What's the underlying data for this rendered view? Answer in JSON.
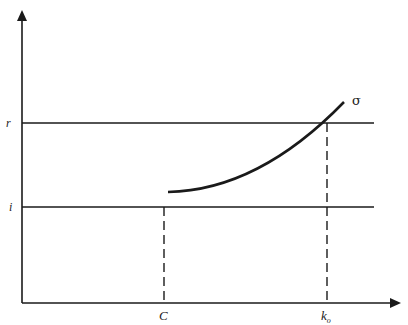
{
  "diagram": {
    "axes": {
      "y_axis": {
        "x": 22,
        "top": 12,
        "bottom": 303
      },
      "x_axis": {
        "y": 303,
        "left": 22,
        "right": 400
      }
    },
    "horizontal_lines": [
      {
        "id": "r",
        "label": "r",
        "y": 123
      },
      {
        "id": "i",
        "label": "i",
        "y": 207
      }
    ],
    "vertical_dashed_lines": [
      {
        "id": "C",
        "label": "C",
        "x": 164,
        "from_y": 207
      },
      {
        "id": "k_o",
        "label": "k",
        "subscript": "o",
        "x": 327,
        "from_y": 123
      }
    ],
    "curve": {
      "label": "σ",
      "start": [
        168,
        192
      ],
      "end": [
        344,
        102
      ]
    },
    "colors": {
      "line": "#1a1a1a",
      "background": "#ffffff"
    }
  }
}
